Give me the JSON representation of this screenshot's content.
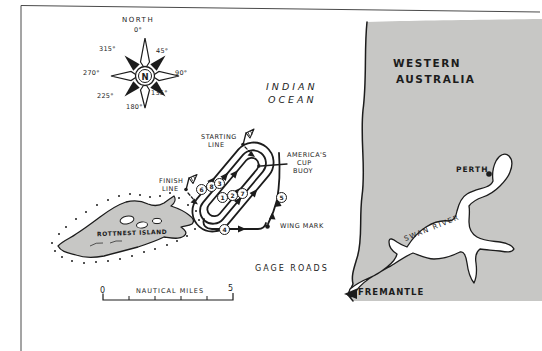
{
  "palette": {
    "ink": "#1c1c1c",
    "land": "#c7c7c5",
    "bg": "#ffffff"
  },
  "compass": {
    "north": "NORTH",
    "center": "N",
    "bearings": [
      "0°",
      "45°",
      "90°",
      "135°",
      "180°",
      "225°",
      "270°",
      "315°"
    ]
  },
  "sea": {
    "ocean1": "INDIAN",
    "ocean2": "OCEAN",
    "gage": "GAGE ROADS"
  },
  "course": {
    "start1": "STARTING",
    "start2": "LINE",
    "finish1": "FINISH",
    "finish2": "LINE",
    "buoy1": "AMERICA'S",
    "buoy2": "CUP",
    "buoy3": "BUOY",
    "wing": "WING MARK",
    "marks": {
      "upper": [
        "6",
        "8",
        "3"
      ],
      "lower": [
        "1",
        "2",
        "7"
      ],
      "side": "5",
      "bottom": "4"
    }
  },
  "island": {
    "name": "ROTTNEST ISLAND"
  },
  "mainland": {
    "state1": "WESTERN",
    "state2": "AUSTRALIA",
    "city": "PERTH",
    "river": "SWAN RIVER",
    "port": "FREMANTLE"
  },
  "scalebar": {
    "zero": "0",
    "five": "5",
    "unit": "NAUTICAL MILES"
  }
}
